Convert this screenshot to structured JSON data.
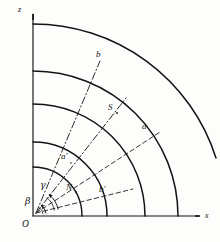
{
  "figure": {
    "type": "geometric-diagram",
    "background_color": "#fdfdfc",
    "ink_color": "#141414",
    "axes": {
      "origin_label": "O",
      "vertical_axis_label": "z",
      "horizontal_axis_label": "x",
      "origin_px": [
        33,
        216
      ],
      "vertical_axis_top_px": [
        33,
        12
      ],
      "horizontal_axis_right_px": [
        200,
        216
      ]
    },
    "arcs": [
      {
        "name": "outer-arc",
        "radius": 145,
        "z_intercept": 71,
        "x_intercept": 178
      },
      {
        "name": "second-arc",
        "radius": 112,
        "z_intercept": 104,
        "x_intercept": 145
      },
      {
        "name": "third-arc",
        "radius": 74,
        "z_intercept": 142,
        "x_intercept": 107
      },
      {
        "name": "fourth-arc",
        "radius": 49,
        "z_intercept": 167,
        "x_intercept": 82
      },
      {
        "name": "top-arc",
        "radius": 192,
        "z_intercept": 24,
        "x_intercept": 225
      }
    ],
    "rays": [
      {
        "name": "ray-to-b",
        "style": "dash-dot",
        "angle_deg": 70,
        "endpoint_label": "b"
      },
      {
        "name": "ray-to-S",
        "style": "dash-dot",
        "angle_deg": 52,
        "endpoint_label": "S"
      },
      {
        "name": "ray-to-a",
        "style": "dashed",
        "angle_deg": 33,
        "endpoint_label": "a"
      },
      {
        "name": "ray-to-b-prime",
        "style": "dashed",
        "angle_deg": 14,
        "endpoint_label": "b'"
      }
    ],
    "points": [
      {
        "label": "b",
        "x": 96,
        "y": 55
      },
      {
        "label": "S",
        "x": 110,
        "y": 108
      },
      {
        "label": "a",
        "x": 143,
        "y": 127
      },
      {
        "label": "a'",
        "x": 63,
        "y": 157
      },
      {
        "label": "N",
        "x": 69,
        "y": 186
      },
      {
        "label": "b'",
        "x": 101,
        "y": 190
      }
    ],
    "angles": [
      {
        "label": "γ",
        "name": "gamma",
        "x": 41,
        "y": 185,
        "arc_radius": 26,
        "from_deg": 14,
        "to_deg": 52
      },
      {
        "label": "β",
        "name": "beta",
        "x": 27,
        "y": 200,
        "arc_radius": 13,
        "from_deg": 0,
        "to_deg": 14
      }
    ]
  }
}
